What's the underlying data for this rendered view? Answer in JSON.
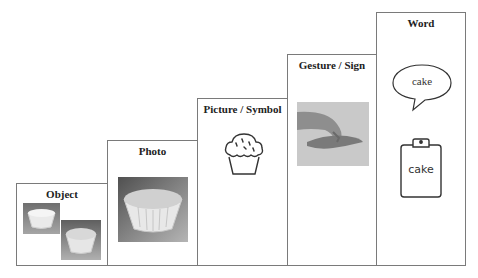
{
  "diagram": {
    "type": "staircase",
    "steps": [
      {
        "label": "Object",
        "content": "photo of two real cupcake objects"
      },
      {
        "label": "Photo",
        "content": "photograph of a cupcake"
      },
      {
        "label": "Picture / Symbol",
        "content": "line drawing of a cupcake"
      },
      {
        "label": "Gesture / Sign",
        "content": "photo of hand sign"
      },
      {
        "label": "Word",
        "content": "speech bubble and clipboard with word"
      }
    ],
    "word_bubble_text": "cake",
    "word_clipboard_text": "cake"
  },
  "colors": {
    "border": "#7a7a7a",
    "text": "#222222",
    "icon_stroke": "#333333"
  }
}
